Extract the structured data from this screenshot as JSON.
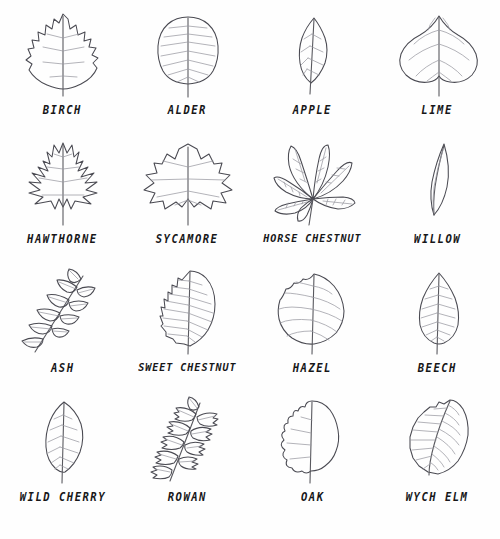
{
  "page": {
    "background_color": "#fefefe",
    "ink_color": "#4a4a52",
    "vein_color": "#9a9aa2",
    "label_color": "#171719",
    "columns": 4,
    "rows": 4
  },
  "leaves": [
    {
      "id": "birch",
      "label": "BIRCH",
      "row": 1,
      "col": 1,
      "shape": "simple-serrated-triangular",
      "veins": 5,
      "margin": "doubly-toothed"
    },
    {
      "id": "alder",
      "label": "ALDER",
      "row": 1,
      "col": 2,
      "shape": "simple-rounded-oval",
      "veins": 9,
      "margin": "finely-toothed"
    },
    {
      "id": "apple",
      "label": "APPLE",
      "row": 1,
      "col": 3,
      "shape": "simple-narrow-ovate",
      "veins": 5,
      "margin": "entire"
    },
    {
      "id": "lime",
      "label": "LIME",
      "row": 1,
      "col": 4,
      "shape": "heart-shaped-cordate",
      "veins": 6,
      "margin": "finely-toothed"
    },
    {
      "id": "hawthorne",
      "label": "HAWTHORNE",
      "row": 2,
      "col": 1,
      "shape": "deeply-lobed",
      "veins": 5,
      "margin": "lobed"
    },
    {
      "id": "sycamore",
      "label": "SYCAMORE",
      "row": 2,
      "col": 2,
      "shape": "palmate-five-lobed",
      "veins": 5,
      "margin": "lobed"
    },
    {
      "id": "horse-chestnut",
      "label": "HORSE CHESTNUT",
      "row": 2,
      "col": 3,
      "shape": "palmate-compound",
      "veins": 7,
      "margin": "compound-leaflets"
    },
    {
      "id": "willow",
      "label": "WILLOW",
      "row": 2,
      "col": 4,
      "shape": "lanceolate-narrow",
      "veins": 2,
      "margin": "entire"
    },
    {
      "id": "ash",
      "label": "ASH",
      "row": 3,
      "col": 1,
      "shape": "pinnate-compound",
      "veins": 9,
      "margin": "compound-leaflets"
    },
    {
      "id": "sweet-chestnut",
      "label": "SWEET CHESTNUT",
      "row": 3,
      "col": 2,
      "shape": "long-toothed-oblong",
      "veins": 14,
      "margin": "sharply-toothed"
    },
    {
      "id": "hazel",
      "label": "HAZEL",
      "row": 3,
      "col": 3,
      "shape": "rounded-broad-ovate",
      "veins": 7,
      "margin": "doubly-toothed"
    },
    {
      "id": "beech",
      "label": "BEECH",
      "row": 3,
      "col": 4,
      "shape": "simple-pointed-oval",
      "veins": 8,
      "margin": "wavy"
    },
    {
      "id": "wild-cherry",
      "label": "WILD CHERRY",
      "row": 4,
      "col": 1,
      "shape": "elongated-ovate",
      "veins": 7,
      "margin": "finely-toothed"
    },
    {
      "id": "rowan",
      "label": "ROWAN",
      "row": 4,
      "col": 2,
      "shape": "pinnate-compound-toothed",
      "veins": 11,
      "margin": "compound-leaflets"
    },
    {
      "id": "oak",
      "label": "OAK",
      "row": 4,
      "col": 3,
      "shape": "lobed-oblong",
      "veins": 1,
      "margin": "rounded-lobes"
    },
    {
      "id": "wych-elm",
      "label": "WYCH ELM",
      "row": 4,
      "col": 4,
      "shape": "asymmetric-ovate",
      "veins": 11,
      "margin": "doubly-toothed"
    }
  ]
}
